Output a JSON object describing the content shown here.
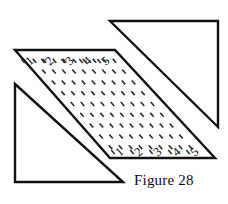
{
  "figure": {
    "caption": "Figure 28",
    "stroke_color": "#111111",
    "fill_color": "#ffffff",
    "dash_color": "#333333",
    "shapes": {
      "parallelogram": {
        "name": "dotted-parallelogram",
        "points": "15,50 115,50 215,158 110,158"
      },
      "upper_right_triangle": {
        "name": "upper-right-triangle",
        "points": "110,21 218,21 218,127"
      },
      "lower_left_triangle": {
        "name": "lower-left-triangle",
        "points": "15,84 123,182 15,182"
      }
    },
    "top_edge_labels": [
      "1",
      "2",
      "3",
      "4",
      "5"
    ],
    "bottom_edge_labels": [
      "1",
      "2",
      "3",
      "4",
      "5"
    ],
    "top_edge_label_positions": [
      {
        "x": 32,
        "y": 64
      },
      {
        "x": 52,
        "y": 64
      },
      {
        "x": 72,
        "y": 64
      },
      {
        "x": 90,
        "y": 64
      },
      {
        "x": 108,
        "y": 64
      }
    ],
    "bottom_edge_label_positions": [
      {
        "x": 122,
        "y": 155
      },
      {
        "x": 141,
        "y": 155
      },
      {
        "x": 160,
        "y": 155
      },
      {
        "x": 179,
        "y": 155
      },
      {
        "x": 197,
        "y": 155
      }
    ],
    "dash_grid": {
      "columns": 9,
      "rows": 9,
      "description": "grid of short slanted dashes filling the parallelogram interior"
    }
  }
}
